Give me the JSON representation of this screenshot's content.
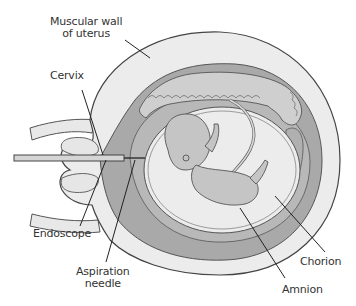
{
  "figure": {
    "colors": {
      "outer_wall": "#ececec",
      "mid_layer": "#a9a9a9",
      "placenta": "#c8c8c8",
      "amniotic_fluid": "#ececec",
      "fetus": "#c5c5c5",
      "outline": "#444444",
      "leader": "#222222"
    }
  },
  "labels": {
    "muscular_wall": [
      "Muscular wall",
      "of uterus"
    ],
    "cervix": "Cervix",
    "endoscope": "Endoscope",
    "aspiration_needle": [
      "Aspiration",
      "needle"
    ],
    "chorion": "Chorion",
    "amnion": "Amnion"
  }
}
